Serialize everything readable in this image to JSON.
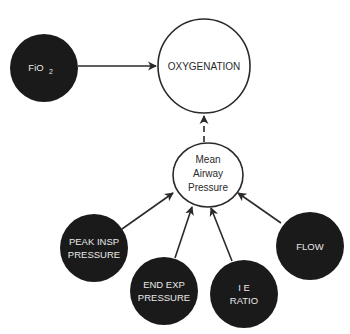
{
  "diagram": {
    "type": "influence-diagram",
    "colors": {
      "dark_node_fill": "#1a1a1a",
      "light_node_fill": "#ffffff",
      "stroke": "#2a2a2a",
      "dark_node_text": "#e8e8e8",
      "light_node_text": "#2a2a2a"
    },
    "nodes": {
      "fio2": {
        "label_main": "FiO",
        "label_sub": "2",
        "style": "dark"
      },
      "oxygenation": {
        "label": "OXYGENATION",
        "style": "light"
      },
      "mean_airway_pressure": {
        "line1": "Mean",
        "line2": "Airway",
        "line3": "Pressure",
        "style": "light"
      },
      "peak_insp_pressure": {
        "line1": "PEAK INSP",
        "line2": "PRESSURE",
        "style": "dark"
      },
      "end_exp_pressure": {
        "line1": "END EXP",
        "line2": "PRESSURE",
        "style": "dark"
      },
      "ie_ratio": {
        "line1": "I E",
        "line2": "RATIO",
        "style": "dark"
      },
      "flow": {
        "label": "FLOW",
        "style": "dark"
      }
    },
    "edges": [
      {
        "from": "FiO2",
        "to": "OXYGENATION",
        "style": "solid"
      },
      {
        "from": "Mean Airway Pressure",
        "to": "OXYGENATION",
        "style": "dashed"
      },
      {
        "from": "PEAK INSP PRESSURE",
        "to": "Mean Airway Pressure",
        "style": "solid"
      },
      {
        "from": "END EXP PRESSURE",
        "to": "Mean Airway Pressure",
        "style": "solid"
      },
      {
        "from": "I E RATIO",
        "to": "Mean Airway Pressure",
        "style": "solid"
      },
      {
        "from": "FLOW",
        "to": "Mean Airway Pressure",
        "style": "solid"
      }
    ]
  }
}
